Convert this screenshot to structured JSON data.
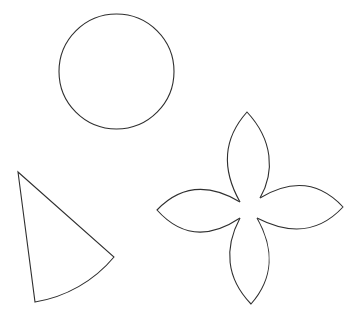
{
  "canvas": {
    "width": 355,
    "height": 325,
    "background": "#ffffff",
    "stroke_color": "#2f2f2f"
  },
  "shapes": [
    {
      "id": "circle",
      "type": "circle",
      "label": "Circle",
      "cx": 116.5,
      "cy": 71.5,
      "r": 57.5
    },
    {
      "id": "sector",
      "type": "circular-sector",
      "label": "Circular sector",
      "apex": [
        18,
        172
      ],
      "arc_start": [
        114,
        257
      ],
      "arc_end": [
        35,
        302
      ],
      "radius": 130
    },
    {
      "id": "flower",
      "type": "four-petal-flower",
      "label": "Four-petal flower",
      "petals": [
        {
          "name": "top",
          "tip": [
            247,
            112
          ]
        },
        {
          "name": "right",
          "tip": [
            343,
            207
          ]
        },
        {
          "name": "bottom",
          "tip": [
            251,
            304
          ]
        },
        {
          "name": "left",
          "tip": [
            157,
            210
          ]
        }
      ]
    }
  ]
}
